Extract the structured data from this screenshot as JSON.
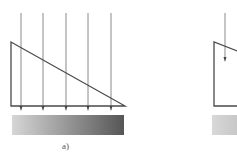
{
  "figure": {
    "panels": [
      {
        "id": "a",
        "label": "a)",
        "rays": 5,
        "shape": "right-triangle wedge",
        "bar": "gradient light-to-dark"
      },
      {
        "id": "b",
        "label": "",
        "rays": 1,
        "shape": "wedge (cropped)",
        "bar": "uniform light gray (cropped)"
      }
    ],
    "colors": {
      "line": "#555555",
      "ray": "#8a8a8a",
      "bar_light": "#d4d4d4",
      "bar_dark": "#555555"
    }
  }
}
